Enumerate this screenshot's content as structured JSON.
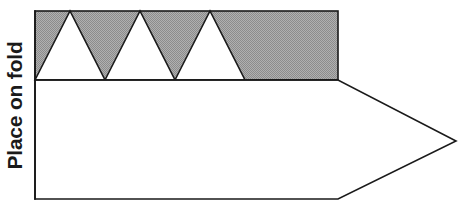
{
  "diagram": {
    "labels": {
      "fold_label": "Place on fold"
    },
    "colors": {
      "shaded_fill": "#a3a3a3",
      "outline": "#1a1a1a",
      "background": "#ffffff",
      "text": "#1a1a1a"
    },
    "geometry": {
      "fold_edge": {
        "x": 35,
        "y_top": 11,
        "y_bottom": 199
      },
      "shaded_band": {
        "x_left": 35,
        "x_right": 338,
        "y_top": 11,
        "y_bottom": 80
      },
      "body_outline_points": "35,80 338,80 456,141 338,199 35,199",
      "point_tip": {
        "x": 456,
        "y": 141
      },
      "triangles": [
        {
          "base_left": 35,
          "apex": 70,
          "base_right": 105,
          "y_base": 80,
          "y_apex": 11
        },
        {
          "base_left": 105,
          "apex": 140,
          "base_right": 175,
          "y_base": 80,
          "y_apex": 11
        },
        {
          "base_left": 175,
          "apex": 210,
          "base_right": 245,
          "y_base": 80,
          "y_apex": 11
        }
      ],
      "triangle_count": 3,
      "stroke_width": 1.6
    }
  }
}
